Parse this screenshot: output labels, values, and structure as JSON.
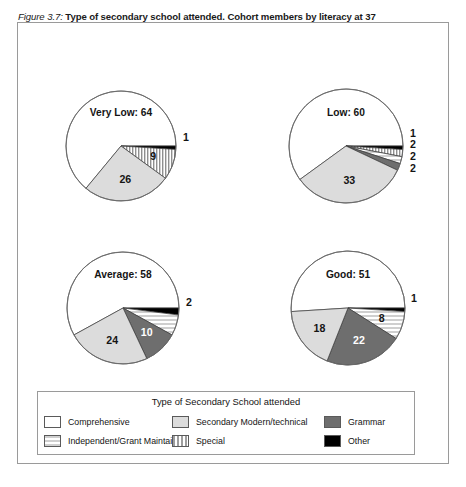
{
  "figure": {
    "number": "Figure 3.7:",
    "caption": "Type of secondary school attended. Cohort members by literacy at 37"
  },
  "legend": {
    "title": "Type of Secondary School attended",
    "items": [
      {
        "label": "Comprehensive",
        "pattern": "white",
        "color": "#ffffff"
      },
      {
        "label": "Secondary Modern/technical",
        "pattern": "lightgray",
        "color": "#dcdcdc"
      },
      {
        "label": "Grammar",
        "pattern": "darkgray",
        "color": "#6e6e6e"
      },
      {
        "label": "Independent/Grant Maintained",
        "pattern": "hstripe",
        "color": "#cfcfcf"
      },
      {
        "label": "Special",
        "pattern": "vstripe",
        "color": "#9e9e9e"
      },
      {
        "label": "Other",
        "pattern": "black",
        "color": "#000000"
      }
    ]
  },
  "chart_data": {
    "type": "pie",
    "title": "Type of secondary school attended. Cohort members by literacy at 37",
    "categories": [
      "Comprehensive",
      "Secondary Modern/technical",
      "Grammar",
      "Independent/Grant Maintained",
      "Special",
      "Other"
    ],
    "units": "percent",
    "panels": [
      {
        "name": "Very Low",
        "center_label": "Very Low: 64",
        "values": [
          64,
          26,
          0,
          0,
          9,
          1
        ],
        "labels_shown": [
          "64",
          "26",
          "9",
          "1"
        ]
      },
      {
        "name": "Low",
        "center_label": "Low: 60",
        "values": [
          60,
          33,
          2,
          2,
          2,
          1
        ],
        "labels_shown": [
          "60",
          "33",
          "2",
          "2",
          "2",
          "1"
        ]
      },
      {
        "name": "Average",
        "center_label": "Average: 58",
        "values": [
          58,
          24,
          10,
          6,
          0,
          2
        ],
        "labels_shown": [
          "58",
          "24",
          "10",
          "6",
          "2"
        ]
      },
      {
        "name": "Good",
        "center_label": "Good: 51",
        "values": [
          51,
          18,
          22,
          8,
          0,
          1
        ],
        "labels_shown": [
          "51",
          "18",
          "22",
          "8",
          "1"
        ]
      }
    ]
  },
  "panels": [
    {
      "id": "very-low",
      "center_label": "Very Low: 64",
      "slices": [
        {
          "key": "comprehensive",
          "value": 64,
          "label": "",
          "pattern": "white"
        },
        {
          "key": "other",
          "value": 1,
          "label": "1",
          "pattern": "black"
        },
        {
          "key": "special",
          "value": 9,
          "label": "9",
          "pattern": "vstripe"
        },
        {
          "key": "secondary-modern",
          "value": 26,
          "label": "26",
          "pattern": "lightgray"
        }
      ]
    },
    {
      "id": "low",
      "center_label": "Low: 60",
      "slices": [
        {
          "key": "comprehensive",
          "value": 60,
          "label": "",
          "pattern": "white"
        },
        {
          "key": "other",
          "value": 1,
          "label": "1",
          "pattern": "black"
        },
        {
          "key": "special",
          "value": 2,
          "label": "2",
          "pattern": "vstripe"
        },
        {
          "key": "independent",
          "value": 2,
          "label": "2",
          "pattern": "hstripe"
        },
        {
          "key": "grammar",
          "value": 2,
          "label": "2",
          "pattern": "darkgray"
        },
        {
          "key": "secondary-modern",
          "value": 33,
          "label": "33",
          "pattern": "lightgray"
        }
      ]
    },
    {
      "id": "average",
      "center_label": "Average: 58",
      "slices": [
        {
          "key": "comprehensive",
          "value": 58,
          "label": "",
          "pattern": "white"
        },
        {
          "key": "other",
          "value": 2,
          "label": "2",
          "pattern": "black"
        },
        {
          "key": "independent",
          "value": 6,
          "label": "6",
          "pattern": "hstripe"
        },
        {
          "key": "grammar",
          "value": 10,
          "label": "10",
          "pattern": "darkgray"
        },
        {
          "key": "secondary-modern",
          "value": 24,
          "label": "24",
          "pattern": "lightgray"
        }
      ]
    },
    {
      "id": "good",
      "center_label": "Good: 51",
      "slices": [
        {
          "key": "comprehensive",
          "value": 51,
          "label": "",
          "pattern": "white"
        },
        {
          "key": "other",
          "value": 1,
          "label": "1",
          "pattern": "black"
        },
        {
          "key": "independent",
          "value": 8,
          "label": "8",
          "pattern": "hstripe"
        },
        {
          "key": "grammar",
          "value": 22,
          "label": "22",
          "pattern": "darkgray"
        },
        {
          "key": "secondary-modern",
          "value": 18,
          "label": "18",
          "pattern": "lightgray"
        }
      ]
    }
  ]
}
